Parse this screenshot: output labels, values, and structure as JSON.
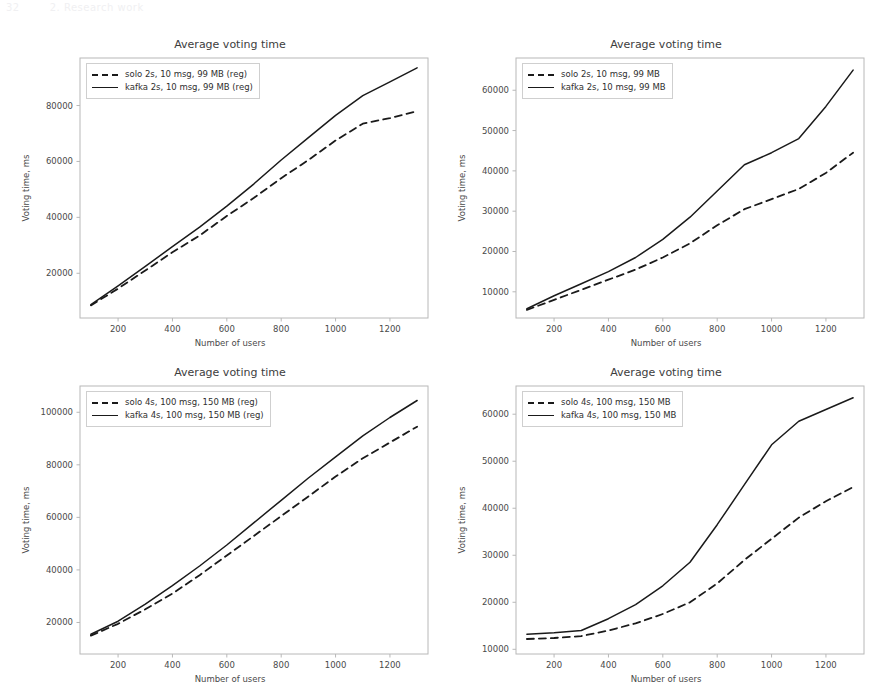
{
  "page_header": {
    "left": "32",
    "right": "2. Research work"
  },
  "figures": [
    {
      "id": "fig-top-left",
      "title": "Average voting time",
      "xlabel": "Number of users",
      "ylabel": "Voting time, ms",
      "xticks": [
        200,
        400,
        600,
        800,
        1000,
        1200
      ],
      "yticks": [
        20000,
        40000,
        60000,
        80000
      ],
      "legend": [
        {
          "label": "solo 2s, 10 msg, 99 MB (reg)",
          "style": "dashed"
        },
        {
          "label": "kafka 2s, 10 msg, 99 MB (reg)",
          "style": "solid"
        }
      ],
      "chart_data": {
        "type": "line",
        "title": "Average voting time",
        "xlabel": "Number of users",
        "ylabel": "Voting time, ms",
        "xlim": [
          60,
          1340
        ],
        "ylim": [
          4000,
          97000
        ],
        "grid": false,
        "legend_position": "upper left",
        "x": [
          100,
          200,
          300,
          400,
          500,
          600,
          700,
          800,
          900,
          1000,
          1100,
          1200,
          1300
        ],
        "series": [
          {
            "name": "solo 2s, 10 msg, 99 MB (reg)",
            "style": "dashed",
            "values": [
              8500,
              14500,
              21000,
              27500,
              33500,
              40500,
              47000,
              54000,
              60500,
              67500,
              73500,
              75500,
              78000
            ]
          },
          {
            "name": "kafka 2s, 10 msg, 99 MB (reg)",
            "style": "solid",
            "values": [
              8800,
              15500,
              22500,
              29500,
              36500,
              44000,
              52000,
              60500,
              68500,
              76500,
              83500,
              88500,
              93500
            ]
          }
        ]
      }
    },
    {
      "id": "fig-top-right",
      "title": "Average voting time",
      "xlabel": "Number of users",
      "ylabel": "Voting time, ms",
      "xticks": [
        200,
        400,
        600,
        800,
        1000,
        1200
      ],
      "yticks": [
        10000,
        20000,
        30000,
        40000,
        50000,
        60000
      ],
      "legend": [
        {
          "label": "solo 2s, 10 msg, 99 MB",
          "style": "dashed"
        },
        {
          "label": "kafka 2s, 10 msg, 99 MB",
          "style": "solid"
        }
      ],
      "chart_data": {
        "type": "line",
        "title": "Average voting time",
        "xlabel": "Number of users",
        "ylabel": "Voting time, ms",
        "xlim": [
          60,
          1340
        ],
        "ylim": [
          3500,
          68000
        ],
        "grid": false,
        "legend_position": "upper left",
        "x": [
          100,
          200,
          300,
          400,
          500,
          600,
          700,
          800,
          900,
          1000,
          1100,
          1200,
          1300
        ],
        "series": [
          {
            "name": "solo 2s, 10 msg, 99 MB",
            "style": "dashed",
            "values": [
              5500,
              8000,
              10500,
              13000,
              15500,
              18500,
              22000,
              26500,
              30500,
              33000,
              35500,
              39500,
              44500
            ]
          },
          {
            "name": "kafka 2s, 10 msg, 99 MB",
            "style": "solid",
            "values": [
              5800,
              9000,
              12000,
              15000,
              18500,
              23000,
              28500,
              35000,
              41500,
              44500,
              48000,
              56000,
              65000
            ]
          }
        ]
      }
    },
    {
      "id": "fig-bottom-left",
      "title": "Average voting time",
      "xlabel": "Number of users",
      "ylabel": "Voting time, ms",
      "xticks": [
        200,
        400,
        600,
        800,
        1000,
        1200
      ],
      "yticks": [
        20000,
        40000,
        60000,
        80000,
        100000
      ],
      "legend": [
        {
          "label": "solo 4s, 100 msg, 150 MB (reg)",
          "style": "dashed"
        },
        {
          "label": "kafka 4s, 100 msg, 150 MB (reg)",
          "style": "solid"
        }
      ],
      "chart_data": {
        "type": "line",
        "title": "Average voting time",
        "xlabel": "Number of users",
        "ylabel": "Voting time, ms",
        "xlim": [
          60,
          1340
        ],
        "ylim": [
          8000,
          110000
        ],
        "grid": false,
        "legend_position": "upper left",
        "x": [
          100,
          200,
          300,
          400,
          500,
          600,
          700,
          800,
          900,
          1000,
          1100,
          1200,
          1300
        ],
        "series": [
          {
            "name": "solo 4s, 100 msg, 150 MB (reg)",
            "style": "dashed",
            "values": [
              15000,
              19500,
              25000,
              31000,
              38000,
              45500,
              53000,
              60500,
              68000,
              75500,
              82500,
              88500,
              94500
            ]
          },
          {
            "name": "kafka 4s, 100 msg, 150 MB (reg)",
            "style": "solid",
            "values": [
              15500,
              20500,
              27000,
              34000,
              41500,
              49500,
              58000,
              66500,
              75000,
              83000,
              91000,
              98000,
              104500
            ]
          }
        ]
      }
    },
    {
      "id": "fig-bottom-right",
      "title": "Average voting time",
      "xlabel": "Number of users",
      "ylabel": "Voting time, ms",
      "xticks": [
        200,
        400,
        600,
        800,
        1000,
        1200
      ],
      "yticks": [
        10000,
        20000,
        30000,
        40000,
        50000,
        60000
      ],
      "legend": [
        {
          "label": "solo 4s, 100 msg, 150 MB",
          "style": "dashed"
        },
        {
          "label": "kafka 4s, 100 msg, 150 MB",
          "style": "solid"
        }
      ],
      "chart_data": {
        "type": "line",
        "title": "Average voting time",
        "xlabel": "Number of users",
        "ylabel": "Voting time, ms",
        "xlim": [
          60,
          1340
        ],
        "ylim": [
          9000,
          66000
        ],
        "grid": false,
        "legend_position": "upper left",
        "x": [
          100,
          200,
          300,
          400,
          500,
          600,
          700,
          800,
          900,
          1000,
          1100,
          1200,
          1300
        ],
        "series": [
          {
            "name": "solo 4s, 100 msg, 150 MB",
            "style": "dashed",
            "values": [
              12200,
              12400,
              12800,
              14000,
              15500,
              17500,
              20000,
              24000,
              29000,
              33500,
              38000,
              41500,
              44500
            ]
          },
          {
            "name": "kafka 4s, 100 msg, 150 MB",
            "style": "solid",
            "values": [
              13200,
              13500,
              14000,
              16500,
              19500,
              23500,
              28500,
              36500,
              45000,
              53500,
              58500,
              61000,
              63500
            ]
          }
        ]
      }
    }
  ],
  "colors": {
    "line": "#1a1a1a",
    "axis": "#b8b8b8",
    "text": "#3d3d3d"
  }
}
